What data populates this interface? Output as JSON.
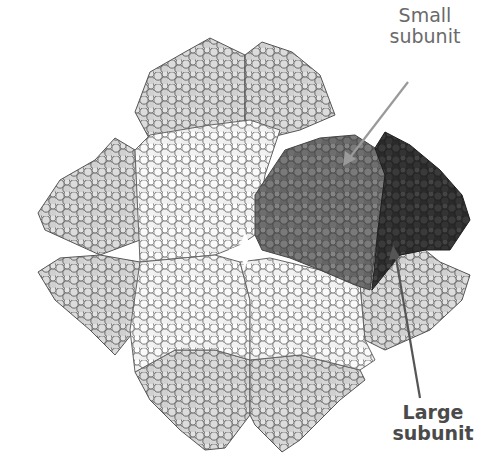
{
  "figure": {
    "labels": {
      "small_subunit": "Small\nsubunit",
      "small_subunit_line1": "Small",
      "small_subunit_line2": "subunit",
      "large_subunit_line1": "Large",
      "large_subunit_line2": "subunit"
    },
    "colors": {
      "background": "#ffffff",
      "light_subunits_fill": "#d4d4d4",
      "white_subunits_fill": "#f4f4f4",
      "atom_outline": "#555555",
      "small_subunit_fill": "#6e6e6e",
      "large_subunit_fill": "#333333",
      "arrow": "#888888",
      "label_text": "#555555"
    }
  }
}
